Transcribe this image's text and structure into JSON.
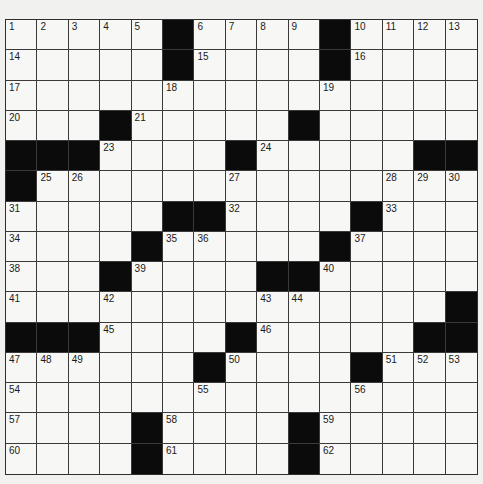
{
  "puzzle": {
    "type": "crossword",
    "rows": 15,
    "cols": 15,
    "colors": {
      "page_background": "#f1f1ef",
      "cell_white": "#f7f7f5",
      "cell_black": "#0b0b0b",
      "grid_line": "#3a3a3a",
      "number_text": "#1a1a1a"
    },
    "layout": [
      "11111#1111#1111",
      "11111#1111#1111",
      "111111111111111",
      "111#11111#11111",
      "###1111#11111###",
      "#111111111111111",
      "11111##1111#111",
      "1111#11111#1111",
      "111#1111##11111",
      "11111111111111#",
      "###1111#11111###",
      "111111#1111#111",
      "111111111111111",
      "1111#1111#11111",
      "1111#1111#11111"
    ],
    "numbers": [
      {
        "row": 0,
        "col": 0,
        "n": "1"
      },
      {
        "row": 0,
        "col": 1,
        "n": "2"
      },
      {
        "row": 0,
        "col": 2,
        "n": "3"
      },
      {
        "row": 0,
        "col": 3,
        "n": "4"
      },
      {
        "row": 0,
        "col": 4,
        "n": "5"
      },
      {
        "row": 0,
        "col": 6,
        "n": "6"
      },
      {
        "row": 0,
        "col": 7,
        "n": "7"
      },
      {
        "row": 0,
        "col": 8,
        "n": "8"
      },
      {
        "row": 0,
        "col": 9,
        "n": "9"
      },
      {
        "row": 0,
        "col": 11,
        "n": "10"
      },
      {
        "row": 0,
        "col": 12,
        "n": "11"
      },
      {
        "row": 0,
        "col": 13,
        "n": "12"
      },
      {
        "row": 0,
        "col": 14,
        "n": "13"
      },
      {
        "row": 1,
        "col": 0,
        "n": "14"
      },
      {
        "row": 1,
        "col": 6,
        "n": "15"
      },
      {
        "row": 1,
        "col": 11,
        "n": "16"
      },
      {
        "row": 2,
        "col": 0,
        "n": "17"
      },
      {
        "row": 2,
        "col": 5,
        "n": "18"
      },
      {
        "row": 2,
        "col": 10,
        "n": "19"
      },
      {
        "row": 3,
        "col": 0,
        "n": "20"
      },
      {
        "row": 3,
        "col": 4,
        "n": "21"
      },
      {
        "row": 3,
        "col": 9,
        "n": "22"
      },
      {
        "row": 4,
        "col": 3,
        "n": "23"
      },
      {
        "row": 4,
        "col": 8,
        "n": "24"
      },
      {
        "row": 5,
        "col": 1,
        "n": "25"
      },
      {
        "row": 5,
        "col": 2,
        "n": "26"
      },
      {
        "row": 5,
        "col": 7,
        "n": "27"
      },
      {
        "row": 5,
        "col": 12,
        "n": "28"
      },
      {
        "row": 5,
        "col": 13,
        "n": "29"
      },
      {
        "row": 5,
        "col": 14,
        "n": "30"
      },
      {
        "row": 6,
        "col": 0,
        "n": "31"
      },
      {
        "row": 6,
        "col": 7,
        "n": "32"
      },
      {
        "row": 6,
        "col": 12,
        "n": "33"
      },
      {
        "row": 7,
        "col": 0,
        "n": "34"
      },
      {
        "row": 7,
        "col": 5,
        "n": "35"
      },
      {
        "row": 7,
        "col": 6,
        "n": "36"
      },
      {
        "row": 7,
        "col": 11,
        "n": "37"
      },
      {
        "row": 8,
        "col": 0,
        "n": "38"
      },
      {
        "row": 8,
        "col": 4,
        "n": "39"
      },
      {
        "row": 8,
        "col": 10,
        "n": "40"
      },
      {
        "row": 9,
        "col": 0,
        "n": "41"
      },
      {
        "row": 9,
        "col": 3,
        "n": "42"
      },
      {
        "row": 9,
        "col": 8,
        "n": "43"
      },
      {
        "row": 9,
        "col": 9,
        "n": "44"
      },
      {
        "row": 10,
        "col": 3,
        "n": "45"
      },
      {
        "row": 10,
        "col": 8,
        "n": "46"
      },
      {
        "row": 11,
        "col": 0,
        "n": "47"
      },
      {
        "row": 11,
        "col": 1,
        "n": "48"
      },
      {
        "row": 11,
        "col": 2,
        "n": "49"
      },
      {
        "row": 11,
        "col": 7,
        "n": "50"
      },
      {
        "row": 11,
        "col": 12,
        "n": "51"
      },
      {
        "row": 11,
        "col": 13,
        "n": "52"
      },
      {
        "row": 11,
        "col": 14,
        "n": "53"
      },
      {
        "row": 12,
        "col": 0,
        "n": "54"
      },
      {
        "row": 12,
        "col": 6,
        "n": "55"
      },
      {
        "row": 12,
        "col": 11,
        "n": "56"
      },
      {
        "row": 13,
        "col": 0,
        "n": "57"
      },
      {
        "row": 13,
        "col": 5,
        "n": "58"
      },
      {
        "row": 13,
        "col": 10,
        "n": "59"
      },
      {
        "row": 14,
        "col": 0,
        "n": "60"
      },
      {
        "row": 14,
        "col": 5,
        "n": "61"
      },
      {
        "row": 14,
        "col": 10,
        "n": "62"
      }
    ]
  }
}
